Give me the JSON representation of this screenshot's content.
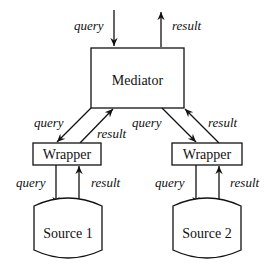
{
  "diagram": {
    "type": "architecture",
    "nodes": {
      "mediator": {
        "label": "Mediator"
      },
      "wrapper1": {
        "label": "Wrapper"
      },
      "wrapper2": {
        "label": "Wrapper"
      },
      "source1": {
        "label": "Source 1"
      },
      "source2": {
        "label": "Source 2"
      }
    },
    "edges": {
      "in_query": {
        "label": "query"
      },
      "out_result": {
        "label": "result"
      },
      "med_w1_query": {
        "label": "query"
      },
      "w1_med_result": {
        "label": "result"
      },
      "med_w2_query": {
        "label": "query"
      },
      "w2_med_result": {
        "label": "result"
      },
      "w1_s1_query": {
        "label": "query"
      },
      "s1_w1_result": {
        "label": "result"
      },
      "w2_s2_query": {
        "label": "query"
      },
      "s2_w2_result": {
        "label": "result"
      }
    },
    "colors": {
      "stroke": "#111111",
      "background": "#ffffff"
    }
  }
}
